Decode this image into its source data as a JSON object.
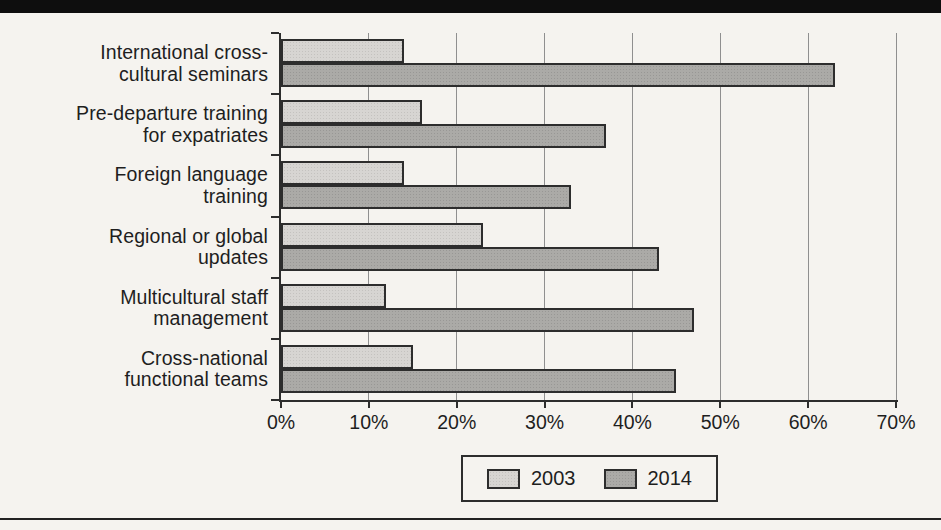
{
  "page": {
    "background": "#f5f3ef",
    "top_bar_color": "#0e0e0e",
    "bottom_rule_color": "#222222",
    "axis_color": "#2d2d2d",
    "gridline_color": "#8f8f8f",
    "text_color": "#1e1e1e"
  },
  "chart_data": {
    "type": "bar",
    "orientation": "horizontal",
    "title": "",
    "xlabel": "",
    "ylabel": "",
    "xlim": [
      0,
      70
    ],
    "grid": true,
    "legend_position": "bottom",
    "x_ticks": [
      "0%",
      "10%",
      "20%",
      "30%",
      "40%",
      "50%",
      "60%",
      "70%"
    ],
    "x_tick_values": [
      0,
      10,
      20,
      30,
      40,
      50,
      60,
      70
    ],
    "categories": [
      "International cross-cultural seminars",
      "Pre-departure training for expatriates",
      "Foreign language training",
      "Regional or global updates",
      "Multicultural staff management",
      "Cross-national functional teams"
    ],
    "category_lines": [
      [
        "International cross-",
        "cultural seminars"
      ],
      [
        "Pre-departure training",
        "for expatriates"
      ],
      [
        "Foreign language",
        "training"
      ],
      [
        "Regional or global",
        "updates"
      ],
      [
        "Multicultural staff",
        "management"
      ],
      [
        "Cross-national",
        "functional teams"
      ]
    ],
    "series": [
      {
        "name": "2003",
        "values": [
          14,
          16,
          14,
          23,
          12,
          15
        ],
        "color": "#d7d5d2",
        "dot_color": "#c4c2bf"
      },
      {
        "name": "2014",
        "values": [
          63,
          37,
          33,
          43,
          47,
          45
        ],
        "color": "#abaaa7",
        "dot_color": "#989795"
      }
    ]
  }
}
